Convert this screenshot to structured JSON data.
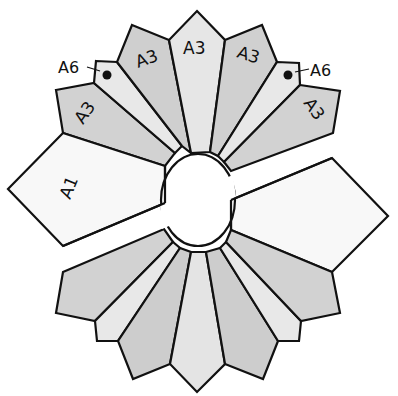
{
  "diagram": {
    "title": "",
    "colors": {
      "background": "#ffffff",
      "outline": "#111111",
      "light": "#ebebeb",
      "medium": "#d4d4d4",
      "dark": "#c8c8c8",
      "white_piece": "#f7f7f7"
    },
    "labels": {
      "a1_left": "A1",
      "a3_top_center": "A3",
      "a3_top_left": "A3",
      "a3_top_right": "A3",
      "a3_outer_left": "A3",
      "a3_outer_right": "A3",
      "a6_left": "A6",
      "a6_right": "A6"
    },
    "pieces": [
      "A1 (left, labeled)",
      "A1 (right, unlabeled)",
      "A3 x5 top fan (labeled)",
      "A6 x2 top fan (labeled with dot)",
      "bottom fan: 7 unlabeled pieces"
    ]
  }
}
